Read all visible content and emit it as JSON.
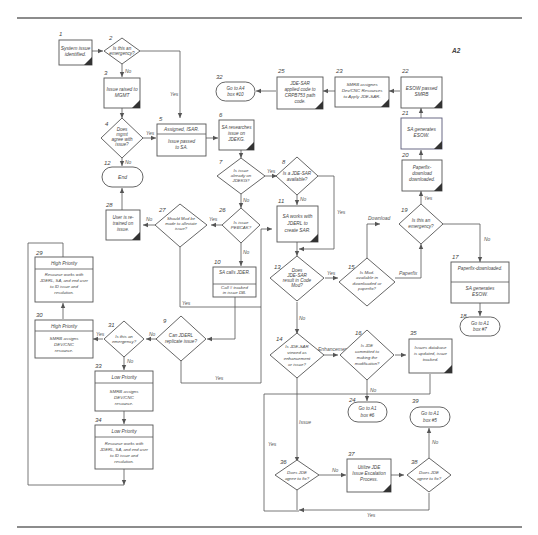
{
  "page": {
    "label": "A2"
  },
  "nodes": {
    "n1": {
      "num": "1",
      "lines": [
        "System issue",
        "identified."
      ]
    },
    "n2": {
      "num": "2",
      "lines": [
        "Is this an",
        "emergency?"
      ]
    },
    "n3": {
      "num": "3",
      "lines": [
        "Issue raised to",
        "MGMT"
      ]
    },
    "n4": {
      "num": "4",
      "lines": [
        "Does",
        "mgmt",
        "agree with",
        "issue?"
      ]
    },
    "n5": {
      "num": "5",
      "header": "Assigned, ISAR.",
      "lines": [
        "Issue passed",
        "to SA."
      ]
    },
    "n6": {
      "num": "6",
      "lines": [
        "SA researches",
        "issue on",
        "JDEKG."
      ]
    },
    "n7": {
      "num": "7",
      "lines": [
        "Is issue",
        "already on",
        "JDEKG?"
      ]
    },
    "n8": {
      "num": "8",
      "lines": [
        "Is a JDE-SAR",
        "available?"
      ]
    },
    "n9": {
      "num": "9",
      "lines": [
        "Can JDERL",
        "replicate issue?"
      ]
    },
    "n10": {
      "num": "10",
      "header": "SA calls JDER.",
      "lines": [
        "Call # tracked",
        "in issue DB."
      ]
    },
    "n11": {
      "num": "11",
      "lines": [
        "SA works with",
        "JDERL to",
        "create SAR."
      ]
    },
    "n12": {
      "num": "12",
      "lines": [
        "End"
      ]
    },
    "n13": {
      "num": "13",
      "lines": [
        "Does",
        "JDE-SAR",
        "result in Code",
        "Mod?"
      ]
    },
    "n14": {
      "num": "14",
      "lines": [
        "Is JDE-SAR",
        "viewed as",
        "enhancement",
        "or issue?"
      ]
    },
    "n15": {
      "num": "15",
      "lines": [
        "Is Mod.",
        "available in",
        "downloaded or",
        "paperfix?"
      ]
    },
    "n16": {
      "num": "16",
      "lines": [
        "Is JDE",
        "committed to",
        "making the",
        "modification?"
      ]
    },
    "n17": {
      "num": "17",
      "header": "Paperfix-downloaded.",
      "lines": [
        "SA generates",
        "ESOW."
      ]
    },
    "n18": {
      "num": "18",
      "lines": [
        "Go to A1",
        "box #7"
      ]
    },
    "n19": {
      "num": "19",
      "lines": [
        "Is this an",
        "emergency?"
      ]
    },
    "n20": {
      "num": "20",
      "lines": [
        "Paperfix-",
        "download",
        "downloaded."
      ]
    },
    "n21": {
      "num": "21",
      "lines": [
        "SA generates",
        "ESOW."
      ]
    },
    "n22": {
      "num": "22",
      "lines": [
        "ESOW passed",
        "SMRB"
      ]
    },
    "n23": {
      "num": "23",
      "lines": [
        "SMRB assignes",
        "Dev/CNC Resources",
        "to Apply JDE-SAR."
      ]
    },
    "n24": {
      "num": "24",
      "lines": [
        "Go to A1",
        "box #6"
      ]
    },
    "n25": {
      "num": "25",
      "lines": [
        "JDE-SAR",
        "applied code to",
        "CRPB753 path",
        "code."
      ]
    },
    "n26": {
      "num": "26",
      "lines": [
        "Is issue",
        "PEBCAK?"
      ]
    },
    "n27": {
      "num": "27",
      "lines": [
        "Should Mod be",
        "made to alleviate",
        "issue?"
      ]
    },
    "n28": {
      "num": "28",
      "lines": [
        "User is re-",
        "trained on",
        "issue."
      ]
    },
    "n29": {
      "num": "29",
      "header": "High Priority",
      "lines": [
        "Resource works with",
        "JDERL, SA, and end user",
        "to ID issue and",
        "resolution."
      ]
    },
    "n30": {
      "num": "30",
      "header": "High Priority",
      "lines": [
        "SMRB assigns",
        "DEV/CNC",
        "resource."
      ]
    },
    "n31": {
      "num": "31",
      "lines": [
        "Is this an",
        "emergency?"
      ]
    },
    "n32": {
      "num": "32",
      "lines": [
        "Go to A4",
        "box #10"
      ]
    },
    "n33": {
      "num": "33",
      "header": "Low Priority",
      "lines": [
        "SMRB assigns",
        "DEV/CNC",
        "resource."
      ]
    },
    "n34": {
      "num": "34",
      "header": "Low Priority",
      "lines": [
        "Resource works with",
        "JDERL, SA, and end user",
        "to ID issue and",
        "resolution."
      ]
    },
    "n35": {
      "num": "35",
      "lines": [
        "Issues database",
        "is updated, issue",
        "tracked."
      ]
    },
    "n36": {
      "num": "36",
      "lines": [
        "Does JDE",
        "agree to fix?"
      ]
    },
    "n37": {
      "num": "37",
      "lines": [
        "Utilize JDE",
        "Issue Escalation",
        "Process."
      ]
    },
    "n38": {
      "num": "38",
      "lines": [
        "Does JDE",
        "agree to fix?"
      ]
    },
    "n39": {
      "num": "39",
      "lines": [
        "Go to A1",
        "box #5"
      ]
    }
  },
  "edge_labels": {
    "yes": "Yes",
    "no": "No",
    "download": "Download",
    "paperfix": "Paperfix",
    "enhancement": "Enhancement",
    "issue": "Issue"
  }
}
